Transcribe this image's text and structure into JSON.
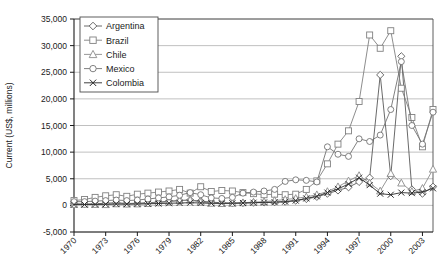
{
  "chart_data": {
    "type": "line",
    "title": "",
    "xlabel": "",
    "ylabel": "Current (US$, millions)",
    "ylim": [
      -5000,
      35000
    ],
    "yticks": [
      -5000,
      0,
      5000,
      10000,
      15000,
      20000,
      25000,
      30000,
      35000
    ],
    "ytick_labels": [
      "-5,000",
      "0",
      "5,000",
      "10,000",
      "15,000",
      "20,000",
      "25,000",
      "30,000",
      "35,000"
    ],
    "xlim": [
      1970,
      2004
    ],
    "xticks": [
      1970,
      1973,
      1976,
      1979,
      1982,
      1985,
      1988,
      1991,
      1994,
      1997,
      2000,
      2003
    ],
    "xtick_labels": [
      "1970",
      "1973",
      "1976",
      "1979",
      "1982",
      "1985",
      "1988",
      "1991",
      "1994",
      "1997",
      "2000",
      "2003"
    ],
    "x": [
      1970,
      1971,
      1972,
      1973,
      1974,
      1975,
      1976,
      1977,
      1978,
      1979,
      1980,
      1981,
      1982,
      1983,
      1984,
      1985,
      1986,
      1987,
      1988,
      1989,
      1990,
      1991,
      1992,
      1993,
      1994,
      1995,
      1996,
      1997,
      1998,
      1999,
      2000,
      2001,
      2002,
      2003,
      2004
    ],
    "grid": true,
    "legend_position": "top-left",
    "marker_legend": {
      "Argentina": "diamond",
      "Brazil": "square",
      "Chile": "triangle",
      "Mexico": "circle",
      "Colombia": "cross"
    },
    "series": [
      {
        "name": "Argentina",
        "marker": "diamond",
        "color": "#595959",
        "values": [
          300,
          250,
          300,
          400,
          500,
          350,
          400,
          500,
          600,
          800,
          900,
          1000,
          800,
          600,
          500,
          400,
          450,
          500,
          550,
          600,
          700,
          900,
          1200,
          1600,
          2200,
          2800,
          3400,
          4400,
          5200,
          24500,
          5500,
          28000,
          3000,
          2200,
          3500
        ]
      },
      {
        "name": "Brazil",
        "marker": "square",
        "color": "#808080",
        "values": [
          900,
          1100,
          1500,
          1800,
          2000,
          1700,
          2100,
          2300,
          2500,
          2700,
          3000,
          2300,
          3500,
          2600,
          2800,
          2700,
          2400,
          2200,
          2000,
          2100,
          2000,
          2100,
          3000,
          4600,
          7800,
          11500,
          14000,
          19500,
          32000,
          29500,
          32800,
          22000,
          16500,
          11000,
          18000
        ]
      },
      {
        "name": "Chile",
        "marker": "triangle",
        "color": "#8c8c8c",
        "values": [
          180,
          200,
          180,
          150,
          300,
          250,
          280,
          350,
          500,
          650,
          900,
          1000,
          600,
          400,
          350,
          400,
          500,
          600,
          700,
          900,
          1100,
          1300,
          1600,
          2000,
          2600,
          3500,
          4600,
          5600,
          4200,
          2700,
          6000,
          4200,
          2600,
          3200,
          6800
        ]
      },
      {
        "name": "Mexico",
        "marker": "circle",
        "color": "#737373",
        "values": [
          700,
          700,
          800,
          900,
          1000,
          900,
          1000,
          1200,
          1400,
          1600,
          1900,
          2400,
          2000,
          1400,
          1300,
          1500,
          2300,
          2500,
          2700,
          3000,
          4500,
          4800,
          4700,
          4400,
          11000,
          9600,
          9200,
          12500,
          12000,
          13200,
          18000,
          27000,
          15000,
          11500,
          17500
        ]
      },
      {
        "name": "Colombia",
        "marker": "cross",
        "color": "#2b2b2b",
        "values": [
          150,
          160,
          170,
          200,
          250,
          230,
          260,
          300,
          350,
          400,
          450,
          500,
          450,
          400,
          380,
          400,
          450,
          500,
          550,
          600,
          700,
          900,
          1300,
          1700,
          2400,
          3100,
          4000,
          5200,
          3800,
          2200,
          2000,
          2400,
          2300,
          2500,
          3200
        ]
      }
    ]
  },
  "axis": {
    "ylabel": "Current (US$, millions)"
  },
  "legend": {
    "entries": [
      {
        "label": "Argentina"
      },
      {
        "label": "Brazil"
      },
      {
        "label": "Chile"
      },
      {
        "label": "Mexico"
      },
      {
        "label": "Colombia"
      }
    ]
  }
}
